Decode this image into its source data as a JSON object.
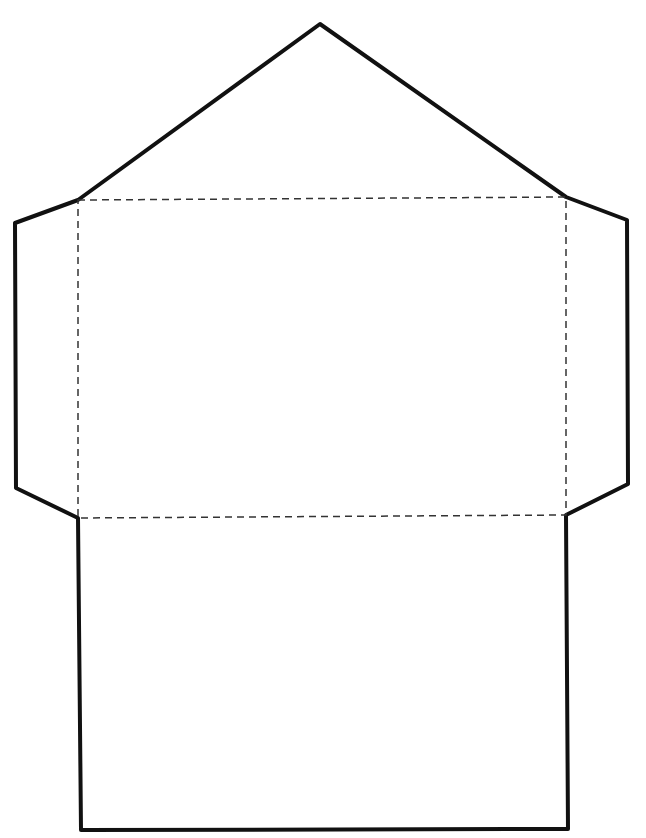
{
  "diagram": {
    "type": "envelope-template",
    "colors": {
      "background": "#ffffff",
      "cut_line": "#111111",
      "fold_line": "#333333"
    },
    "cut_outline": {
      "stroke_width": 4,
      "points": [
        [
          320,
          24
        ],
        [
          566,
          197
        ],
        [
          627,
          220
        ],
        [
          628,
          484
        ],
        [
          566,
          515
        ],
        [
          568,
          829
        ],
        [
          81,
          830
        ],
        [
          78,
          518
        ],
        [
          16,
          488
        ],
        [
          15,
          223
        ],
        [
          78,
          200
        ]
      ]
    },
    "fold_lines": {
      "stroke_width": 1.5,
      "dash": "7 5",
      "rect": {
        "top_left": [
          78,
          200
        ],
        "top_right": [
          566,
          197
        ],
        "bottom_right": [
          566,
          515
        ],
        "bottom_left": [
          78,
          518
        ]
      }
    },
    "parts": [
      {
        "name": "top-flap"
      },
      {
        "name": "left-side-flap"
      },
      {
        "name": "right-side-flap"
      },
      {
        "name": "envelope-front-panel"
      },
      {
        "name": "bottom-flap"
      }
    ]
  }
}
